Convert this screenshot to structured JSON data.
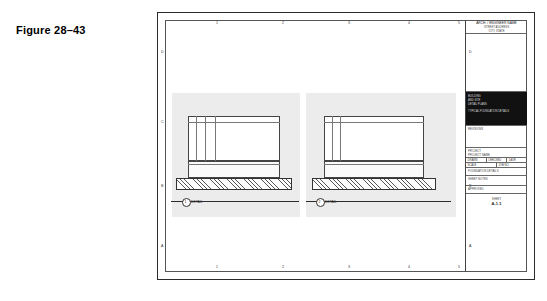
{
  "figure": {
    "label": "Figure 28–43"
  },
  "sheet": {
    "zones_top": [
      "1",
      "2",
      "3",
      "4",
      "5"
    ],
    "zones_bottom": [
      "1",
      "2",
      "3",
      "4",
      "5"
    ],
    "zones_left": [
      "D",
      "C",
      "B",
      "A"
    ],
    "zones_right": [
      "D",
      "C",
      "B",
      "A"
    ]
  },
  "details": [
    {
      "id": "detail-left",
      "tag": "1",
      "caption": "DETAIL"
    },
    {
      "id": "detail-right",
      "tag": "2",
      "caption": "DETAIL"
    }
  ],
  "title_block": {
    "firm_name": "ARCH. / ENGINEER NAME",
    "firm_sub": "STREET ADDRESS",
    "firm_city": "CITY, STATE",
    "firm_phone": "PHONE NUMBER",
    "logo_lines": [
      "BUILDING",
      "AND SITE",
      "DETAIL PLANS",
      "",
      "TYPICAL FOUNDATION DETAILS"
    ],
    "revisions_header": "REVISIONS",
    "project_label": "PROJECT",
    "project_value": "PROJECT NAME",
    "drawn_label": "DRAWN",
    "checked_label": "CHECKED",
    "date_label": "DATE",
    "scale_label": "SCALE",
    "job_label": "JOB NO.",
    "sheet_label": "SHEET",
    "sheet_number": "A-1.1",
    "drawing_title": "FOUNDATION DETAILS",
    "notes_label": "SHEET NOTES",
    "approved_label": "APPROVED"
  }
}
